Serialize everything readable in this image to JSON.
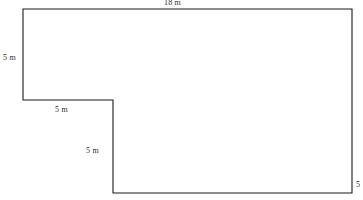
{
  "figure": {
    "unit": "m",
    "stroke_color": "#1a1a1a",
    "fill_color": "#ffffff",
    "background_color": "#ffffff",
    "label_color": "#2b2b2b",
    "outline_points": "23,9 352,9 352,193 113,193 113,100 23,100"
  },
  "labels": {
    "top": "18 m",
    "left": "5 m",
    "middle": "5 m",
    "notch": "5 m",
    "edge_clipped": "5"
  },
  "chart_data": {
    "type": "diagram",
    "shape": "L-shaped hexagon",
    "title": "18 m",
    "vertices": [
      {
        "x": 23,
        "y": 9,
        "name": "top-left"
      },
      {
        "x": 352,
        "y": 9,
        "name": "top-right"
      },
      {
        "x": 352,
        "y": 193,
        "name": "bottom-right"
      },
      {
        "x": 113,
        "y": 193,
        "name": "bottom-left"
      },
      {
        "x": 113,
        "y": 100,
        "name": "notch-inner-corner"
      },
      {
        "x": 23,
        "y": 100,
        "name": "notch-left"
      }
    ],
    "edges": [
      {
        "from": "top-left",
        "to": "top-right",
        "label": "18 m",
        "orientation": "horizontal"
      },
      {
        "from": "top-right",
        "to": "bottom-right",
        "label": "",
        "orientation": "vertical"
      },
      {
        "from": "bottom-right",
        "to": "bottom-left",
        "label": "",
        "orientation": "horizontal"
      },
      {
        "from": "bottom-left",
        "to": "notch-inner-corner",
        "label": "",
        "orientation": "vertical"
      },
      {
        "from": "notch-inner-corner",
        "to": "notch-left",
        "label": "5 m",
        "orientation": "horizontal"
      },
      {
        "from": "notch-left",
        "to": "top-left",
        "label": "5 m",
        "orientation": "vertical"
      }
    ],
    "annotations": [
      {
        "text": "18 m",
        "position": "above-top-edge",
        "clipped": true
      },
      {
        "text": "5 m",
        "position": "left-of-left-edge",
        "clipped": false
      },
      {
        "text": "5 m",
        "position": "below-middle-horizontal-edge",
        "clipped": false
      },
      {
        "text": "5 m",
        "position": "left-of-notch-vertical-edge",
        "clipped": false
      },
      {
        "text": "5",
        "position": "right-image-edge",
        "clipped": true
      }
    ],
    "xlabel": "",
    "ylabel": "",
    "grid": false,
    "legend": false
  }
}
